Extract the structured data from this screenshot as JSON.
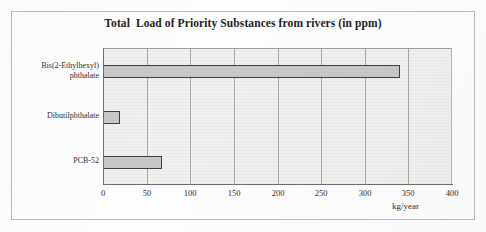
{
  "chart_data": {
    "type": "bar",
    "orientation": "horizontal",
    "title": "Total  Load of Priority Substances from rivers (in ppm)",
    "categories": [
      "Bis(2-Ethylhexyl) phthalate",
      "Dibutilphthalate",
      "PCB-52"
    ],
    "category_lines": [
      [
        "Bis(2-Ethylhexyl)",
        "phthalate"
      ],
      [
        "Dibutilphthalate"
      ],
      [
        "PCB-52"
      ]
    ],
    "values": [
      340,
      20,
      68
    ],
    "xlabel": "kg/year",
    "ylabel": "",
    "xlim": [
      0,
      400
    ],
    "xticks": [
      0,
      50,
      100,
      150,
      200,
      250,
      300,
      350,
      400
    ],
    "xtick_labels": [
      "0",
      "50",
      "100",
      "150",
      "200",
      "250",
      "300",
      "350",
      "400"
    ],
    "grid": true,
    "grid_axis": "x",
    "legend": false,
    "series": [
      {
        "name": "Total Load",
        "values": [
          340,
          20,
          68
        ]
      }
    ],
    "colors": {
      "bar_fill": "#c9c9c9",
      "bar_border": "#3f3f3f",
      "plot_background": "#f0f0ef",
      "gridline": "#a8a8a8",
      "axis": "#6d6d6d",
      "text": "#2e2e2e",
      "title": "#1d1d1d",
      "frame_border": "#b9b9b9"
    }
  }
}
